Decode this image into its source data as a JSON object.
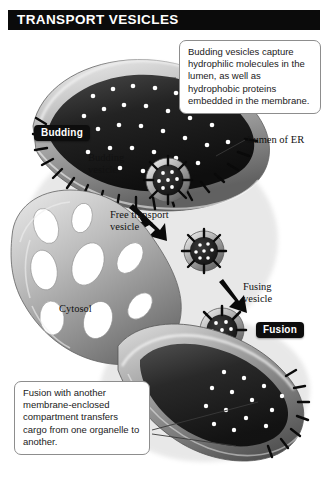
{
  "header": {
    "title": "TRANSPORT VESICLES"
  },
  "callouts": [
    {
      "id": "top",
      "text": "Budding vesicles capture hydrophilic molecules in the lumen, as well as hydrophobic proteins embedded in the membrane."
    },
    {
      "id": "bottom",
      "text": "Fusion with another membrane-enclosed compartment transfers cargo from one organelle to another."
    }
  ],
  "badges": [
    {
      "id": "budding",
      "label": "Budding"
    },
    {
      "id": "fusion",
      "label": "Fusion"
    }
  ],
  "labels": [
    {
      "id": "lumen",
      "line1": "Lumen of ER",
      "line2": ""
    },
    {
      "id": "budding_ves",
      "line1": "Budding",
      "line2": "vesicle"
    },
    {
      "id": "free_ves",
      "line1": "Free transport",
      "line2": "vesicle"
    },
    {
      "id": "fusing_ves",
      "line1": "Fusing",
      "line2": "vesicle"
    },
    {
      "id": "cytosol",
      "line1": "Cytosol",
      "line2": ""
    }
  ],
  "diagram": {
    "structures": [
      "endoplasmic-reticulum",
      "er-lumen",
      "budding-vesicle",
      "free-transport-vesicle",
      "fusing-vesicle",
      "target-organelle"
    ],
    "cargo_molecules": "hydrophilic molecules shown as white dots",
    "membrane_proteins": "hydrophobic proteins shown as black spikes",
    "transport_arrows": 3
  },
  "colors": {
    "header_bg": "#0b0b0b",
    "header_text": "#ffffff",
    "badge_bg": "#0d0d0d",
    "badge_text": "#ffffff",
    "callout_border": "#8d8d8d",
    "callout_bg": "#ffffff",
    "page_bg": "#ffffff",
    "membrane_light": "#d8d8d8",
    "membrane_mid": "#9a9a9a",
    "membrane_dark": "#5a5a5a",
    "lumen_dark": "#1d1d1d",
    "cargo_dot": "#ffffff",
    "protein_spike": "#0a0a0a"
  }
}
